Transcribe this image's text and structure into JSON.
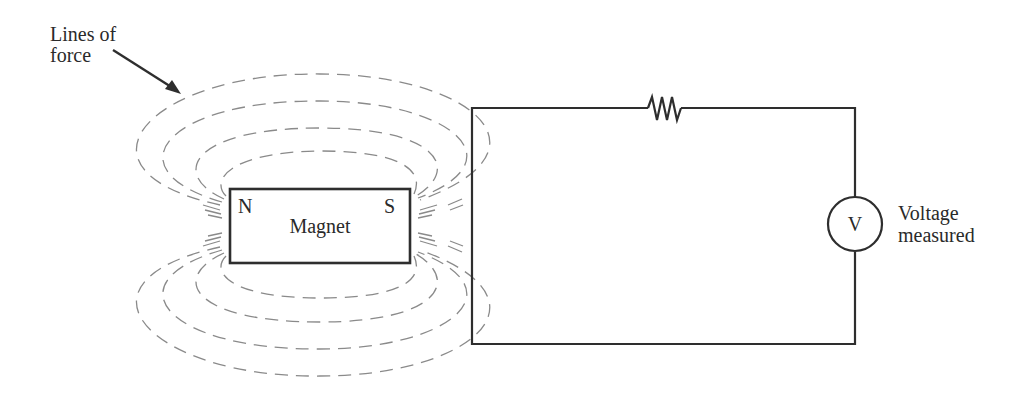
{
  "figure": {
    "type": "schematic"
  },
  "labels": {
    "lines_of_force_line1": "Lines of",
    "lines_of_force_line2": "force",
    "north_pole": "N",
    "south_pole": "S",
    "magnet": "Magnet",
    "voltmeter_symbol": "V",
    "voltage_line1": "Voltage",
    "voltage_line2": "measured"
  },
  "components": [
    {
      "id": "magnet",
      "kind": "bar-magnet",
      "poles": [
        "N",
        "S"
      ]
    },
    {
      "id": "resistor",
      "kind": "resistor",
      "position": "top wire of circuit"
    },
    {
      "id": "voltmeter",
      "kind": "voltmeter",
      "position": "right wire of circuit"
    },
    {
      "id": "field-lines",
      "kind": "dashed magnetic field loops",
      "count_above": 4,
      "count_below": 4
    }
  ],
  "colors": {
    "wire": "#2e2e2e",
    "field_lines": "#8a8a8a",
    "text": "#2a2a2a",
    "background": "#ffffff"
  }
}
